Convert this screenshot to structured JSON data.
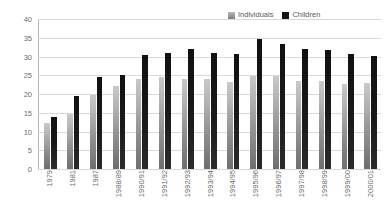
{
  "chart_data": {
    "type": "bar",
    "title": "",
    "subtitle": "",
    "xlabel": "",
    "ylabel": "",
    "ylim": [
      0,
      40
    ],
    "yticks": [
      0,
      5,
      10,
      15,
      20,
      25,
      30,
      35,
      40
    ],
    "grid": true,
    "legend_position": "top-right",
    "categories": [
      "1979",
      "1981",
      "1987",
      "1988/89",
      "1990/91",
      "1991/92",
      "1992/93",
      "1993/94",
      "1994/95",
      "1995/96",
      "1996/97",
      "1997/98",
      "1998/99",
      "1999/00",
      "2000/01"
    ],
    "series": [
      {
        "name": "Individuals",
        "color": "#9a9a9a",
        "values": [
          12.4,
          14.8,
          19.7,
          22.1,
          24.0,
          24.6,
          24.0,
          24.0,
          23.1,
          24.7,
          24.7,
          23.6,
          23.6,
          22.7,
          22.9
        ]
      },
      {
        "name": "Children",
        "color": "#141414",
        "values": [
          13.9,
          19.6,
          24.6,
          25.1,
          30.3,
          30.9,
          31.9,
          30.9,
          30.8,
          34.6,
          33.4,
          31.9,
          31.7,
          30.8,
          30.2
        ]
      }
    ]
  },
  "legend": {
    "entries": [
      {
        "label": "Individuals",
        "swatch": "individuals-swatch"
      },
      {
        "label": "Children",
        "swatch": "children-swatch"
      }
    ]
  },
  "colors": {
    "gridline": "#d9d9d9",
    "axis": "#b5b5b5",
    "tick_text": "#6b6b6b",
    "individuals": "#9a9a9a",
    "children": "#141414",
    "background": "#ffffff"
  }
}
